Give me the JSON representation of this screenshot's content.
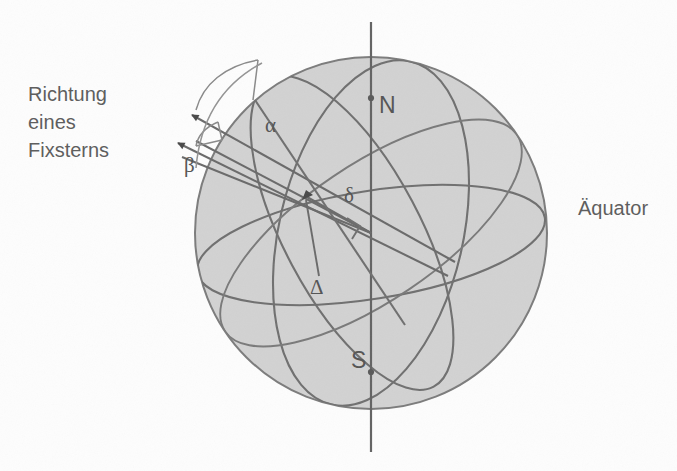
{
  "figure": {
    "background_color": "#fdfdfd",
    "sphere_fill": "#d2d2d2",
    "line_color": "#6f6f6f",
    "text_color": "#555555"
  },
  "labels": {
    "caption_line1": "Richtung",
    "caption_line2": "eines",
    "caption_line3": "Fixsterns",
    "equator": "Äquator",
    "north_pole": "N",
    "south_pole": "S",
    "alpha": "α",
    "beta": "β",
    "delta": "δ",
    "big_delta": "Δ"
  },
  "geometry": {
    "sphere_center_x": 371,
    "sphere_center_y": 233,
    "sphere_radius": 176,
    "axis_top_y": 22,
    "axis_bottom_y": 452,
    "north_pole_x": 371,
    "north_pole_y": 98,
    "south_pole_x": 371,
    "south_pole_y": 372,
    "star_point_x": 307,
    "star_point_y": 197,
    "arrow1_tip_x": 184,
    "arrow1_tip_y": 111,
    "arrow2_tip_x": 170,
    "arrow2_tip_y": 139
  }
}
